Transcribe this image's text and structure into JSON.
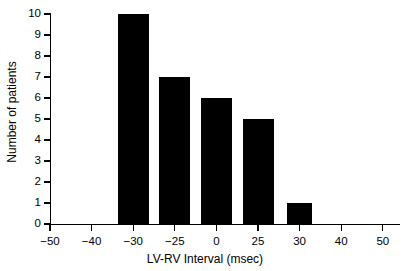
{
  "chart_data": {
    "type": "bar",
    "title": "",
    "subtitle": "",
    "xlabel": "LV-RV Interval (msec)",
    "ylabel": "Number of patients",
    "categories": [
      "−50",
      "−40",
      "−30",
      "−25",
      "0",
      "25",
      "30",
      "40",
      "50"
    ],
    "values": [
      0,
      0,
      10,
      7,
      6,
      5,
      1,
      0,
      0
    ],
    "bars": [
      {
        "category": "−30",
        "value": 10
      },
      {
        "category": "−25",
        "value": 7
      },
      {
        "category": "0",
        "value": 6
      },
      {
        "category": "25",
        "value": 5
      },
      {
        "category": "30",
        "value": 1
      }
    ],
    "ylim": [
      0,
      10
    ],
    "yticks": [
      "0",
      "1",
      "2",
      "3",
      "4",
      "5",
      "6",
      "7",
      "8",
      "9",
      "10"
    ],
    "xticks": [
      "−50",
      "−40",
      "−30",
      "−25",
      "0",
      "25",
      "30",
      "40",
      "50"
    ],
    "grid": false,
    "legend": null,
    "bar_color": "#000000",
    "background_color": "#ffffff",
    "axis_color": "#000000"
  },
  "axes": {
    "x_title": "LV-RV Interval (msec)",
    "y_title": "Number of patients"
  }
}
